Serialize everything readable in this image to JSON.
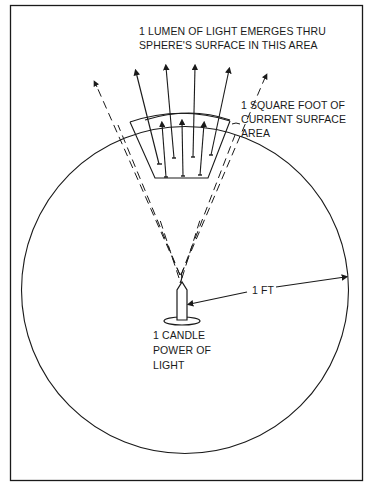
{
  "diagram": {
    "title_label": {
      "line1": "1 LUMEN OF LIGHT EMERGES THRU",
      "line2": "SPHERE'S SURFACE IN THIS AREA"
    },
    "area_label": {
      "line1": "1 SQUARE FOOT OF",
      "line2": "CURRENT SURFACE",
      "line3": "AREA"
    },
    "radius_label": "1 FT",
    "source_label": {
      "line1": "1 CANDLE",
      "line2": "POWER OF",
      "line3": "LIGHT"
    },
    "colors": {
      "ink": "#1a1a1a",
      "background": "#ffffff"
    }
  }
}
